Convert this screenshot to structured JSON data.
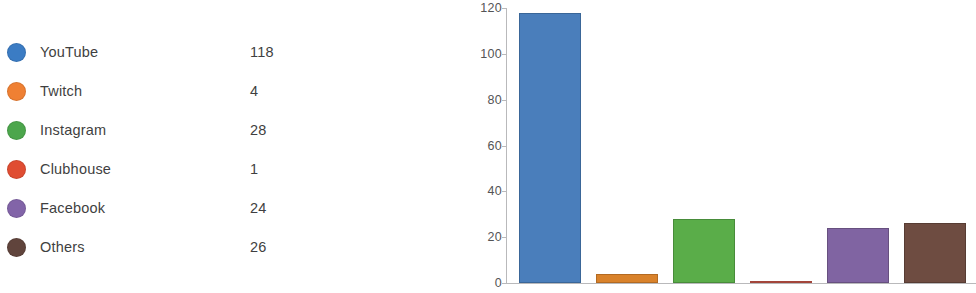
{
  "legend": {
    "items": [
      {
        "label": "YouTube",
        "value": "118",
        "color": "#3b7cc4"
      },
      {
        "label": "Twitch",
        "value": "4",
        "color": "#ef8033"
      },
      {
        "label": "Instagram",
        "value": "28",
        "color": "#4ca64c"
      },
      {
        "label": "Clubhouse",
        "value": "1",
        "color": "#e04d32"
      },
      {
        "label": "Facebook",
        "value": "24",
        "color": "#8264a8"
      },
      {
        "label": "Others",
        "value": "26",
        "color": "#60443c"
      }
    ]
  },
  "chart_data": {
    "type": "bar",
    "title": "",
    "xlabel": "",
    "ylabel": "",
    "categories": [
      "YouTube",
      "Twitch",
      "Instagram",
      "Clubhouse",
      "Facebook",
      "Others"
    ],
    "values": [
      118,
      4,
      28,
      1,
      24,
      26
    ],
    "colors": [
      "#4a7ebb",
      "#d9822b",
      "#5aad49",
      "#c9564a",
      "#8064a2",
      "#6e4c41"
    ],
    "bar_border_colors": [
      "#3a6698",
      "#b36a22",
      "#488c3a",
      "#a3453b",
      "#67507f",
      "#573c33"
    ],
    "ylim": [
      0,
      120
    ],
    "yticks": [
      0,
      20,
      40,
      60,
      80,
      100,
      120
    ],
    "ytick_labels": [
      "0",
      "20",
      "40",
      "60",
      "80",
      "100",
      "120"
    ],
    "grid": false,
    "legend_position": "left-panel"
  }
}
